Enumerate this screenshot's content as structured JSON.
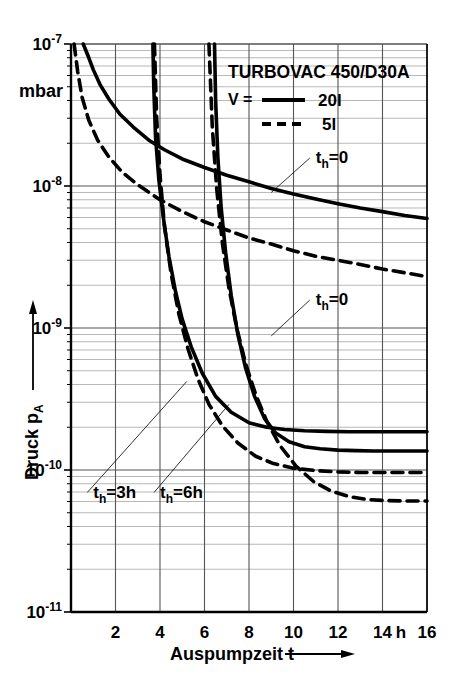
{
  "chart_data": {
    "type": "line",
    "title": "TURBOVAC 450/D30A",
    "xlabel": "Auspumpzeit t",
    "ylabel": "Druck p",
    "ylabel_sub": "A",
    "yunit": "mbar",
    "xunit": "h",
    "xlim": [
      0,
      16
    ],
    "ylim": [
      1e-11,
      1e-07
    ],
    "yscale": "log",
    "grid": true,
    "legend_position": "top-right",
    "xticks": [
      2,
      4,
      6,
      8,
      10,
      12,
      14,
      16
    ],
    "xtick_labels": [
      "2",
      "4",
      "6",
      "8",
      "10",
      "12",
      "14",
      "16"
    ],
    "yticks": [
      1e-07,
      1e-08,
      1e-09,
      1e-10,
      1e-11
    ],
    "ytick_labels": [
      "10",
      "10",
      "10",
      "10",
      "10"
    ],
    "ytick_exponents": [
      "-7",
      "-8",
      "-9",
      "-10",
      "-11"
    ],
    "legend": [
      {
        "symbol": "V =",
        "line": "solid",
        "label": "20l"
      },
      {
        "symbol": "",
        "line": "dashed",
        "label": "5l"
      }
    ],
    "annotations": [
      {
        "text": "t",
        "sub": "h",
        "rest": "=0",
        "x": 11.0,
        "y": 1.45e-08,
        "target_x": 9.0,
        "target_y": 9e-09
      },
      {
        "text": "t",
        "sub": "h",
        "rest": "=0",
        "x": 11.0,
        "y": 1.45e-09,
        "target_x": 9.0,
        "target_y": 8.8e-10
      },
      {
        "text": "t",
        "sub": "h",
        "rest": "=3h",
        "x": 1.0,
        "y": 6.4e-11,
        "target_x": 5.2,
        "target_y": 4.2e-10
      },
      {
        "text": "t",
        "sub": "h",
        "rest": "=6h",
        "x": 4.0,
        "y": 6.4e-11,
        "target_x": 7.1,
        "target_y": 2.9e-10
      }
    ],
    "series": [
      {
        "name": "th=0, V=20l",
        "style": "solid",
        "x": [
          0.55,
          0.8,
          1.0,
          1.3,
          1.7,
          2.2,
          2.8,
          3.5,
          4.2,
          5.0,
          6.0,
          7.0,
          8.0,
          9.0,
          10.0,
          11.0,
          12.0,
          13.0,
          14.0,
          15.0,
          16.0
        ],
        "y": [
          1e-07,
          8e-08,
          6.6e-08,
          5.2e-08,
          4.1e-08,
          3.2e-08,
          2.6e-08,
          2.1e-08,
          1.8e-08,
          1.55e-08,
          1.35e-08,
          1.19e-08,
          1.07e-08,
          9.6e-09,
          8.8e-09,
          8.1e-09,
          7.5e-09,
          7e-09,
          6.6e-09,
          6.2e-09,
          5.9e-09
        ]
      },
      {
        "name": "th=0, V=5l",
        "style": "dashed",
        "x": [
          0.14,
          0.3,
          0.5,
          0.8,
          1.2,
          1.7,
          2.3,
          3.0,
          4.0,
          5.0,
          6.0,
          7.0,
          8.0,
          9.0,
          10.0,
          11.0,
          12.0,
          13.0,
          14.0,
          15.0,
          16.0
        ],
        "y": [
          1e-07,
          6.4e-08,
          4.2e-08,
          2.9e-08,
          2.1e-08,
          1.6e-08,
          1.25e-08,
          1.02e-08,
          8e-09,
          6.6e-09,
          5.6e-09,
          4.9e-09,
          4.3e-09,
          3.9e-09,
          3.5e-09,
          3.2e-09,
          3e-09,
          2.8e-09,
          2.6e-09,
          2.45e-09,
          2.3e-09
        ]
      },
      {
        "name": "th=3h, V=20l",
        "style": "solid",
        "x": [
          3.68,
          3.72,
          3.8,
          3.95,
          4.15,
          4.4,
          4.7,
          5.0,
          5.4,
          5.9,
          6.5,
          7.2,
          8.0,
          8.8,
          9.6,
          10.5,
          11.5,
          12.5,
          13.5,
          14.5,
          16.0
        ],
        "y": [
          1e-07,
          5e-08,
          2.2e-08,
          1.1e-08,
          6e-09,
          3.2e-09,
          1.8e-09,
          1.15e-09,
          7.4e-10,
          4.8e-10,
          3.3e-10,
          2.55e-10,
          2.15e-10,
          2e-10,
          1.93e-10,
          1.89e-10,
          1.87e-10,
          1.86e-10,
          1.86e-10,
          1.86e-10,
          1.86e-10
        ]
      },
      {
        "name": "th=6h, V=20l",
        "style": "solid",
        "x": [
          6.45,
          6.5,
          6.6,
          6.75,
          6.95,
          7.2,
          7.5,
          7.85,
          8.25,
          8.7,
          9.2,
          9.8,
          10.5,
          11.2,
          12.0,
          12.8,
          13.6,
          14.5,
          15.2,
          16.0
        ],
        "y": [
          1e-07,
          4e-08,
          1.6e-08,
          7e-09,
          3.4e-09,
          1.7e-09,
          9e-10,
          5.2e-10,
          3.3e-10,
          2.3e-10,
          1.82e-10,
          1.58e-10,
          1.46e-10,
          1.41e-10,
          1.38e-10,
          1.37e-10,
          1.36e-10,
          1.36e-10,
          1.36e-10,
          1.36e-10
        ]
      },
      {
        "name": "th=3h, V=5l",
        "style": "dashed",
        "x": [
          3.75,
          3.85,
          4.0,
          4.2,
          4.5,
          4.85,
          5.25,
          5.7,
          6.2,
          6.8,
          7.5,
          8.3,
          9.1,
          10.0,
          11.0,
          12.0,
          13.0,
          14.0,
          15.0,
          16.0
        ],
        "y": [
          1e-07,
          3e-08,
          1.2e-08,
          5.2e-09,
          2.4e-09,
          1.25e-09,
          7.2e-10,
          4.4e-10,
          2.9e-10,
          2.05e-10,
          1.55e-10,
          1.25e-10,
          1.11e-10,
          1.03e-10,
          9.9e-11,
          9.7e-11,
          9.6e-11,
          9.6e-11,
          9.6e-11,
          9.6e-11
        ]
      },
      {
        "name": "th=6h, V=5l",
        "style": "dashed",
        "x": [
          6.2,
          6.35,
          6.55,
          6.8,
          7.1,
          7.45,
          7.85,
          8.3,
          8.8,
          9.4,
          10.1,
          10.9,
          11.7,
          12.5,
          13.3,
          14.1,
          15.0,
          16.0
        ],
        "y": [
          1e-07,
          2.6e-08,
          9.5e-09,
          4e-09,
          1.9e-09,
          1e-09,
          5.6e-10,
          3.4e-10,
          2.2e-10,
          1.48e-10,
          1.07e-10,
          8.3e-11,
          7.1e-11,
          6.5e-11,
          6.2e-11,
          6.1e-11,
          6.05e-11,
          6.05e-11
        ]
      }
    ]
  },
  "colors": {
    "ink": "#000000",
    "grid": "#555555",
    "minor_grid": "#888888",
    "background": "#ffffff"
  }
}
